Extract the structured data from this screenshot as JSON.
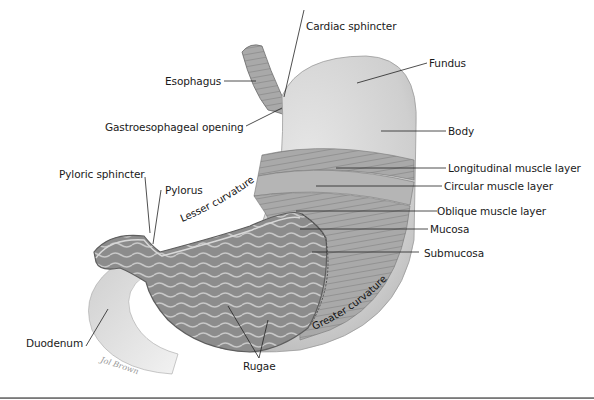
{
  "diagram": {
    "colors": {
      "background": "#ffffff",
      "outer_wall": "#d6d6d6",
      "muscle": "#a8a8a8",
      "mucosa": "#8f8f8f",
      "label_text": "#1a1a1a",
      "leader_line": "#222222"
    },
    "labels": {
      "cardiac_sphincter": "Cardiac sphincter",
      "fundus": "Fundus",
      "esophagus": "Esophagus",
      "gastroesophageal_opening": "Gastroesophageal opening",
      "body": "Body",
      "longitudinal_muscle_layer": "Longitudinal muscle layer",
      "pyloric_sphincter": "Pyloric sphincter",
      "pylorus": "Pylorus",
      "circular_muscle_layer": "Circular muscle layer",
      "lesser_curvature": "Lesser curvature",
      "oblique_muscle_layer": "Oblique muscle layer",
      "mucosa": "Mucosa",
      "submucosa": "Submucosa",
      "greater_curvature": "Greater curvature",
      "duodenum": "Duodenum",
      "rugae": "Rugae",
      "artist_signature": "Jol Brown"
    }
  }
}
